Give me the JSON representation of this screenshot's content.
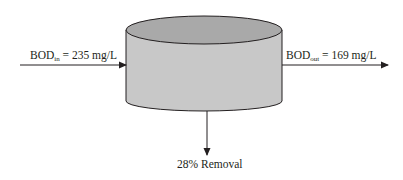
{
  "diagram": {
    "type": "reactor-flow",
    "inlet": {
      "label_main": "BOD",
      "label_sub": "in",
      "label_value": " = 235 mg/L"
    },
    "outlet": {
      "label_main": "BOD",
      "label_sub": "out",
      "label_value": " = 169 mg/L"
    },
    "removal": {
      "label": "28% Removal"
    },
    "colors": {
      "tank_body": "#c8c8c8",
      "tank_top": "#a9a9a9",
      "stroke": "#231f20"
    }
  }
}
